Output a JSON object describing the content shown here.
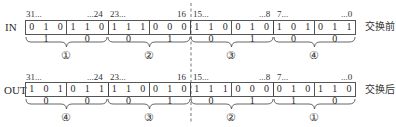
{
  "diagram": {
    "type": "byte-swap",
    "rows": [
      {
        "label": "IN",
        "suffix": "交换前",
        "bit_ranges": [
          {
            "start": "31...",
            "end": "...24"
          },
          {
            "start": "23...",
            "end": "16"
          },
          {
            "start": "15...",
            "end": "...8"
          },
          {
            "start": "7...",
            "end": "...0"
          }
        ],
        "nibbles": [
          "0 1 0 1",
          "1 1 0 0",
          "1 1 1 0",
          "0 0 0 1",
          "1 1 0 0",
          "0 1 0 1",
          "1 0 1 0",
          "0 1 1 0"
        ],
        "byte_markers": [
          "①",
          "②",
          "③",
          "④"
        ]
      },
      {
        "label": "OUT",
        "suffix": "交换后",
        "bit_ranges": [
          {
            "start": "31...",
            "end": "...24"
          },
          {
            "start": "23...",
            "end": "16"
          },
          {
            "start": "15...",
            "end": "...8"
          },
          {
            "start": "7...",
            "end": "...0"
          }
        ],
        "nibbles": [
          "1 0 1 0",
          "0 1 1 0",
          "1 1 0 0",
          "0 1 0 1",
          "1 1 1 0",
          "0 0 0 1",
          "0 1 0 1",
          "1 1 0 0"
        ],
        "byte_markers": [
          "④",
          "③",
          "②",
          "①"
        ]
      }
    ],
    "colors": {
      "line": "#555555",
      "text": "#2a2a2a",
      "background": "#ffffff"
    }
  }
}
